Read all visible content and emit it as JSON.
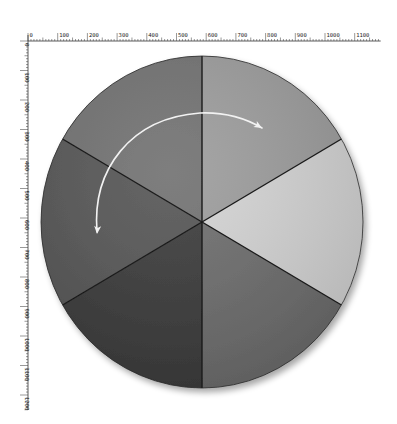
{
  "rulers": {
    "horizontal": {
      "labels": [
        "0",
        "100",
        "200",
        "300",
        "400",
        "500",
        "600",
        "700",
        "800",
        "900",
        "1000",
        "1100"
      ],
      "origin_x": 28,
      "y": 41,
      "label_spacing_px": 29.7
    },
    "vertical": {
      "labels": [
        "0",
        "100",
        "200",
        "300",
        "400",
        "500",
        "600",
        "700",
        "800",
        "900",
        "1000",
        "1100",
        "1200"
      ],
      "origin_y": 41,
      "x": 28,
      "label_spacing_px": 29.5
    }
  },
  "pie": {
    "center": [
      202,
      222
    ],
    "rx": 161,
    "ry": 166,
    "slices": [
      {
        "name": "right",
        "start_deg": -30,
        "end_deg": 30,
        "color": "#d4d4d4"
      },
      {
        "name": "bottom-right",
        "start_deg": 30,
        "end_deg": 90,
        "color": "#6c6c6c"
      },
      {
        "name": "bottom-left",
        "start_deg": 90,
        "end_deg": 150,
        "color": "#393939"
      },
      {
        "name": "left",
        "start_deg": 150,
        "end_deg": 210,
        "color": "#545454"
      },
      {
        "name": "top-left",
        "start_deg": 210,
        "end_deg": 270,
        "color": "#707070"
      },
      {
        "name": "top-right",
        "start_deg": 270,
        "end_deg": 330,
        "color": "#9c9c9c"
      }
    ],
    "divider_color": "#1a1a1a"
  },
  "arrow": {
    "color": "#f2f2f2",
    "path": "M 97 232 C 92 170 130 118 200 113 C 225 112 245 118 262 128",
    "heads": [
      {
        "at": [
          262,
          128
        ],
        "angle_deg": 30
      },
      {
        "at": [
          97,
          234
        ],
        "angle_deg": 95
      }
    ]
  },
  "chart_data": {
    "type": "pie",
    "title": "",
    "categories": [
      "right",
      "bottom-right",
      "bottom-left",
      "left",
      "top-left",
      "top-right"
    ],
    "values": [
      1,
      1,
      1,
      1,
      1,
      1
    ],
    "colors": [
      "#d4d4d4",
      "#6c6c6c",
      "#393939",
      "#545454",
      "#707070",
      "#9c9c9c"
    ],
    "annotations": [
      "double-headed curved arrow spanning top-right to left slices"
    ]
  }
}
